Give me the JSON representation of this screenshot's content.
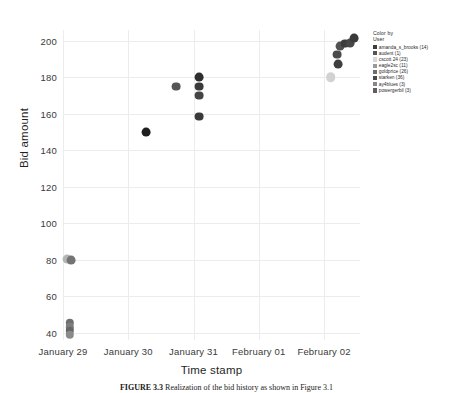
{
  "chart_data": {
    "type": "scatter",
    "title": "",
    "xlabel": "Time stamp",
    "ylabel": "Bid amount",
    "grid": true,
    "xticks": [
      "January 29",
      "January 30",
      "January 31",
      "February 01",
      "February 02"
    ],
    "yticks": [
      40,
      60,
      80,
      100,
      120,
      140,
      160,
      180,
      200
    ],
    "ylim": [
      36,
      206
    ],
    "xlim": [
      0,
      4.55
    ],
    "legend": {
      "position": "right",
      "title_line1": "Color by",
      "title_line2": "User",
      "entries": [
        {
          "label": "amanda_s_brooks (14)",
          "color": "#3d3d3d"
        },
        {
          "label": "audent (1)",
          "color": "#555555"
        },
        {
          "label": "cscott 24 (23)",
          "color": "#d8d8d8"
        },
        {
          "label": "eagle2sc (11)",
          "color": "#9a9a9a"
        },
        {
          "label": "goldprice (26)",
          "color": "#6e6e6e"
        },
        {
          "label": "starken (36)",
          "color": "#4a4a4a"
        },
        {
          "label": "ay4blues (3)",
          "color": "#868686"
        },
        {
          "label": "powergerbil (3)",
          "color": "#5f5f5f"
        }
      ]
    },
    "points": [
      {
        "x": 0.06,
        "y": 80.5,
        "color": "#b5b5b5",
        "r": 4.4
      },
      {
        "x": 0.13,
        "y": 80.0,
        "color": "#747474",
        "r": 4.4
      },
      {
        "x": 0.1,
        "y": 45.5,
        "color": "#6f6f6f",
        "r": 4.2
      },
      {
        "x": 0.1,
        "y": 43.0,
        "color": "#7d7d7d",
        "r": 4.2
      },
      {
        "x": 0.1,
        "y": 41.0,
        "color": "#666666",
        "r": 4.2
      },
      {
        "x": 0.1,
        "y": 39.0,
        "color": "#8a8a8a",
        "r": 4.2
      },
      {
        "x": 1.27,
        "y": 150.0,
        "color": "#1f1f1f",
        "r": 4.4
      },
      {
        "x": 1.73,
        "y": 175.0,
        "color": "#555555",
        "r": 4.4
      },
      {
        "x": 2.08,
        "y": 180.0,
        "color": "#2e2e2e",
        "r": 4.4
      },
      {
        "x": 2.08,
        "y": 175.0,
        "color": "#3a3a3a",
        "r": 4.4
      },
      {
        "x": 2.08,
        "y": 170.0,
        "color": "#444444",
        "r": 4.4
      },
      {
        "x": 2.08,
        "y": 158.5,
        "color": "#3a3a3a",
        "r": 4.4
      },
      {
        "x": 4.1,
        "y": 180.0,
        "color": "#d2d2d2",
        "r": 4.8
      },
      {
        "x": 4.2,
        "y": 192.5,
        "color": "#4a4a4a",
        "r": 4.4
      },
      {
        "x": 4.22,
        "y": 187.5,
        "color": "#3f3f3f",
        "r": 4.4
      },
      {
        "x": 4.25,
        "y": 197.0,
        "color": "#525252",
        "r": 4.4
      },
      {
        "x": 4.32,
        "y": 198.5,
        "color": "#3d3d3d",
        "r": 4.4
      },
      {
        "x": 4.4,
        "y": 199.0,
        "color": "#474747",
        "r": 4.4
      },
      {
        "x": 4.46,
        "y": 201.5,
        "color": "#3a3a3a",
        "r": 4.4
      }
    ]
  },
  "caption": {
    "figure_number": "FIGURE 3.3",
    "text": "Realization of the bid history as shown in Figure 3.1"
  }
}
